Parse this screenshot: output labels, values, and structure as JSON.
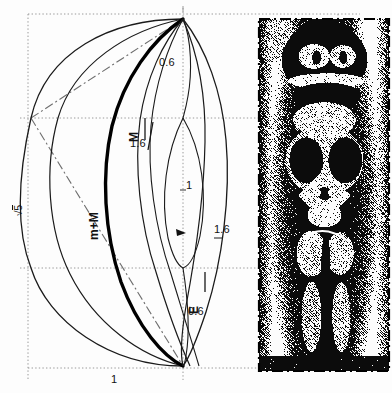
{
  "figure": {
    "width": 392,
    "height": 393,
    "background": "#fdfdfd",
    "ink_color": "#111111",
    "grid_color": "#8a8a8a"
  },
  "labels": {
    "sqrt5": "5",
    "sqrt_symbol": "√",
    "m_plus_M": "m+M",
    "M": "M",
    "E": "E",
    "v_0_6_top": "0.6",
    "v_1_6_left": "1.6",
    "v_1_center": "1",
    "v_1_6_right": "1.6",
    "v_0_6_bottom": "0.6",
    "v_1_bottom": "1"
  },
  "construction": {
    "unit_square": {
      "left": 28,
      "top": 14,
      "right": 338,
      "bottom": 368
    },
    "grid_lines": {
      "vertical_x": [
        28,
        183,
        338
      ],
      "horizontal_y": [
        14,
        118,
        268,
        368
      ],
      "style": "dotted"
    },
    "apex_top": {
      "x": 183,
      "y": 19
    },
    "apex_bottom": {
      "x": 183,
      "y": 366
    },
    "node_left": {
      "x": 31,
      "y": 118
    },
    "node_center_upper": {
      "x": 183,
      "y": 118
    },
    "node_center_lower": {
      "x": 183,
      "y": 268
    },
    "node_mid": {
      "x": 183,
      "y": 232
    },
    "curves": [
      {
        "name": "m+M",
        "weight": "heavy",
        "value": "m+M"
      },
      {
        "name": "M",
        "weight": "light",
        "value": "M"
      },
      {
        "name": "E",
        "weight": "light",
        "value": "E"
      },
      {
        "name": "sqrt5-arc",
        "weight": "medium",
        "value": "√5"
      }
    ],
    "dash_dot_diagonal": {
      "from": {
        "x": 31,
        "y": 118
      },
      "to": {
        "x": 183,
        "y": 19
      }
    }
  },
  "photo": {
    "caption": "carved seated figure",
    "frame_style": "dash-dot",
    "left": 259,
    "top": 19,
    "width": 130,
    "height": 352,
    "description": "halftone dithered photograph of a carved wooden seated figure"
  }
}
